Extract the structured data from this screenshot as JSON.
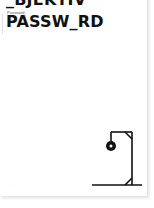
{
  "game": {
    "previous_word": "_BJEKTIV",
    "label": "Password",
    "current_word": "PASSW_RD",
    "footer_hint": "· · · · · ·"
  },
  "hangman": {
    "stage_parts_drawn": [
      "base",
      "post",
      "beam",
      "brace-top",
      "brace-bottom",
      "rope",
      "head"
    ],
    "stroke_color": "#111111"
  }
}
